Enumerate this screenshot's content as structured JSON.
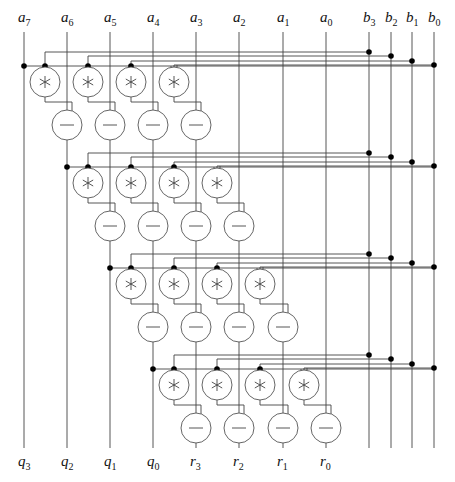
{
  "diagram": {
    "top_labels": [
      {
        "base": "a",
        "sub": "7",
        "x": 24
      },
      {
        "base": "a",
        "sub": "6",
        "x": 67
      },
      {
        "base": "a",
        "sub": "5",
        "x": 110
      },
      {
        "base": "a",
        "sub": "4",
        "x": 153
      },
      {
        "base": "a",
        "sub": "3",
        "x": 196
      },
      {
        "base": "a",
        "sub": "2",
        "x": 239
      },
      {
        "base": "a",
        "sub": "1",
        "x": 283
      },
      {
        "base": "a",
        "sub": "0",
        "x": 326
      },
      {
        "base": "b",
        "sub": "3",
        "x": 369
      },
      {
        "base": "b",
        "sub": "2",
        "x": 391
      },
      {
        "base": "b",
        "sub": "1",
        "x": 412
      },
      {
        "base": "b",
        "sub": "0",
        "x": 434
      }
    ],
    "bottom_labels": [
      {
        "base": "q",
        "sub": "3",
        "x": 24
      },
      {
        "base": "q",
        "sub": "2",
        "x": 67
      },
      {
        "base": "q",
        "sub": "1",
        "x": 110
      },
      {
        "base": "q",
        "sub": "0",
        "x": 153
      },
      {
        "base": "r",
        "sub": "3",
        "x": 196
      },
      {
        "base": "r",
        "sub": "2",
        "x": 239
      },
      {
        "base": "r",
        "sub": "1",
        "x": 283
      },
      {
        "base": "r",
        "sub": "0",
        "x": 326
      }
    ],
    "operators": {
      "multiply_symbol": "∗",
      "subtract_symbol": "—",
      "multiply_icon": "asterisk-circle-icon",
      "subtract_icon": "minus-circle-icon"
    },
    "stages": 4,
    "cells_per_stage": 4,
    "colors": {
      "wire": "#444444",
      "node": "#000000",
      "background": "#ffffff"
    }
  }
}
